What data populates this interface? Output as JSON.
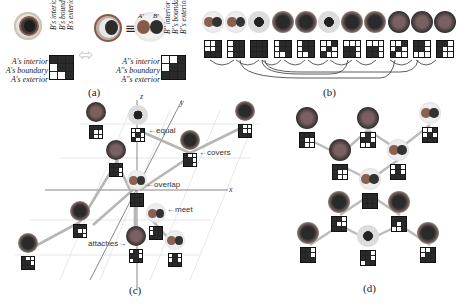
{
  "panel_a": {
    "caption": "(a)",
    "row_labels_left": [
      "A's interior",
      "A's boundary",
      "A's exterior"
    ],
    "col_labels_left": [
      "B's interior",
      "B's boundary",
      "B's exterior"
    ],
    "row_labels_right": [
      "A''s interior",
      "A''s boundary",
      "A''s exterior"
    ],
    "col_labels_right": [
      "B'' interior",
      "B''s boundary",
      "B''s exterior"
    ],
    "matrix_left": [
      0,
      0,
      0,
      1,
      0,
      0,
      1,
      1,
      0
    ],
    "matrix_right": [
      1,
      1,
      0,
      1,
      0,
      0,
      0,
      0,
      0
    ],
    "equiv_symbol": "≡",
    "blob_labels": [
      "A'",
      "B'"
    ]
  },
  "panel_b": {
    "caption": "(b)",
    "matrices": [
      [
        1,
        1,
        0,
        1,
        1,
        0,
        0,
        0,
        0
      ],
      [
        1,
        0,
        0,
        1,
        0,
        0,
        1,
        0,
        0
      ],
      [
        0,
        0,
        0,
        0,
        0,
        0,
        0,
        0,
        0
      ],
      [
        1,
        0,
        0,
        1,
        0,
        0,
        1,
        1,
        0
      ],
      [
        1,
        0,
        0,
        1,
        0,
        0,
        1,
        1,
        0
      ],
      [
        1,
        1,
        0,
        1,
        0,
        1,
        0,
        1,
        1
      ],
      [
        1,
        1,
        1,
        0,
        0,
        1,
        0,
        0,
        1
      ],
      [
        1,
        1,
        1,
        0,
        0,
        1,
        0,
        0,
        1
      ],
      [
        1,
        1,
        0,
        1,
        0,
        1,
        0,
        1,
        1
      ],
      [
        0,
        0,
        1,
        0,
        0,
        1,
        1,
        1,
        1
      ],
      [
        0,
        0,
        1,
        0,
        1,
        1,
        0,
        1,
        1
      ]
    ]
  },
  "panel_c": {
    "caption": "(c)",
    "axes": {
      "x": "x",
      "y": "y",
      "z": "z"
    },
    "relations": [
      "←equal",
      "←covers",
      "←overlap",
      "←meet",
      "attaches→"
    ]
  },
  "panel_d": {
    "caption": "(d)"
  }
}
